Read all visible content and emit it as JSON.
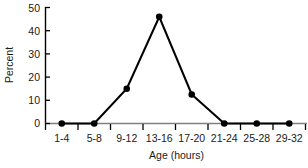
{
  "chart_data": {
    "type": "line",
    "title": "",
    "xlabel": "Age (hours)",
    "ylabel": "Percent",
    "categories": [
      "1-4",
      "5-8",
      "9-12",
      "13-16",
      "17-20",
      "21-24",
      "25-28",
      "29-32"
    ],
    "values": [
      0,
      0,
      15,
      46,
      12.5,
      0,
      0,
      0
    ],
    "series": [
      {
        "name": "Percent",
        "values": [
          0,
          0,
          15,
          46,
          12.5,
          0,
          0,
          0
        ]
      }
    ],
    "ylim": [
      0,
      50
    ],
    "yticks": [
      0,
      10,
      20,
      30,
      40,
      50
    ],
    "ytick_labels": [
      "0",
      "10",
      "20",
      "30",
      "40",
      "50"
    ],
    "xtick_labels": [
      "1-4",
      "5-8",
      "9-12",
      "13-16",
      "17-20",
      "21-24",
      "25-28",
      "29-32"
    ],
    "grid": false,
    "legend": "none",
    "marker": "filled-circle",
    "line_color": "#000000",
    "marker_color": "#000000",
    "axis_color": "#000000",
    "background_color": "#ffffff"
  }
}
